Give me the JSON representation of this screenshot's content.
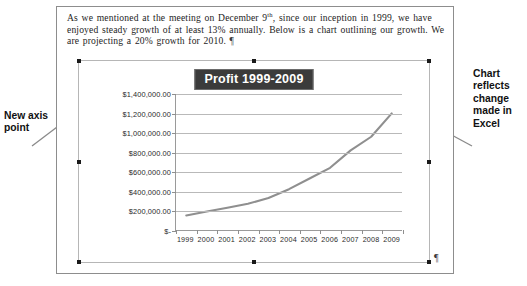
{
  "document": {
    "paragraph_parts": {
      "p1": "As we mentioned  at the meeting  on December 9",
      "sup": "th",
      "p2": ", since our inception  in 1999, we have enjoyed steady growth of at least 13% annually.  Below is a chart outlining  our growth.  We are projecting  a 20% growth for 2010. ",
      "pilcrow": "¶"
    },
    "chart_end_pilcrow": "¶"
  },
  "annotations": {
    "left": "New axis point",
    "right": "Chart reflects change made in Excel"
  },
  "colors": {
    "title_background": "#3b3b3b",
    "title_text": "#ffffff",
    "series_line": "#8f8f8f",
    "gridline": "#b9b9b9",
    "axis": "#9a9a9a",
    "selection_handle": "#1a1a1a",
    "document_border": "#8d8d8d",
    "chart_border": "#b6b6b6"
  },
  "chart_data": {
    "type": "line",
    "title": "Profit 1999-2009",
    "xlabel": "",
    "ylabel": "",
    "grid": true,
    "legend": "none",
    "categories": [
      "1999",
      "2000",
      "2001",
      "2002",
      "2003",
      "2004",
      "2005",
      "2006",
      "2007",
      "2008",
      "2009"
    ],
    "values": [
      150000,
      190000,
      230000,
      270000,
      330000,
      420000,
      530000,
      640000,
      820000,
      960000,
      1200000
    ],
    "series": [
      {
        "name": "Profit",
        "values": [
          150000,
          190000,
          230000,
          270000,
          330000,
          420000,
          530000,
          640000,
          820000,
          960000,
          1200000
        ]
      }
    ],
    "ylim": [
      0,
      1400000
    ],
    "ytick_values": [
      1400000,
      1200000,
      1000000,
      800000,
      600000,
      400000,
      200000,
      0
    ],
    "ytick_labels": [
      "$1,400,000.00",
      "$1,200,000.00",
      "$1,000,000.00",
      "$800,000.00",
      "$600,000.00",
      "$400,000.00",
      "$200,000.00",
      "$-"
    ]
  }
}
